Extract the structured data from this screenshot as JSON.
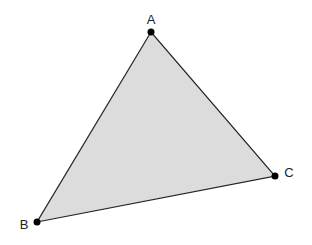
{
  "diagram": {
    "type": "triangle",
    "fill_color": "#dcdcdc",
    "stroke_color": "#222222",
    "vertex_color": "#000000",
    "vertices": [
      {
        "label": "A",
        "x": 151,
        "y": 32,
        "label_x": 151,
        "label_y": 24
      },
      {
        "label": "B",
        "x": 37,
        "y": 222,
        "label_x": 24,
        "label_y": 229
      },
      {
        "label": "C",
        "x": 275,
        "y": 176,
        "label_x": 289,
        "label_y": 177
      }
    ]
  }
}
